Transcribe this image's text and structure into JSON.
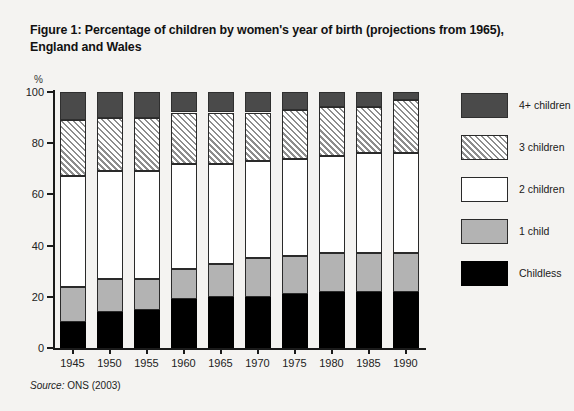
{
  "figure": {
    "title": "Figure 1: Percentage of children by women's year of birth (projections from 1965), England and Wales",
    "source_prefix": "Source:",
    "source_text": " ONS (2003)",
    "background_color": "#f4f3f1"
  },
  "legend": {
    "position": "right",
    "items": [
      {
        "label": "4+ children",
        "swatch": "dark-gray-fill",
        "color": "#4a4a4a"
      },
      {
        "label": "3 children",
        "swatch": "diagonal-hatch-fill",
        "color": "#8d8d8d"
      },
      {
        "label": "2 children",
        "swatch": "white-fill",
        "color": "#ffffff"
      },
      {
        "label": "1 child",
        "swatch": "light-gray-fill",
        "color": "#b3b3b3"
      },
      {
        "label": "Childless",
        "swatch": "black-fill",
        "color": "#000000"
      }
    ]
  },
  "chart_data": {
    "type": "bar",
    "stacked": true,
    "title": "Figure 1: Percentage of children by women's year of birth (projections from 1965), England and Wales",
    "xlabel": "",
    "ylabel": "%",
    "ylim": [
      0,
      100
    ],
    "yticks": [
      0,
      20,
      40,
      60,
      80,
      100
    ],
    "ytick_labels": [
      "0",
      "20",
      "40",
      "60",
      "80",
      "100"
    ],
    "grid": false,
    "legend_position": "right",
    "categories": [
      "1945",
      "1950",
      "1955",
      "1960",
      "1965",
      "1970",
      "1975",
      "1980",
      "1985",
      "1990"
    ],
    "series": [
      {
        "name": "Childless",
        "values": [
          10,
          14,
          15,
          19,
          20,
          20,
          21,
          22,
          22,
          22
        ]
      },
      {
        "name": "1 child",
        "values": [
          14,
          13,
          12,
          12,
          13,
          15,
          15,
          15,
          15,
          15
        ]
      },
      {
        "name": "2 children",
        "values": [
          43,
          42,
          42,
          41,
          39,
          38,
          38,
          38,
          39,
          39
        ]
      },
      {
        "name": "3 children",
        "values": [
          22,
          21,
          21,
          20,
          20,
          19,
          19,
          19,
          18,
          21
        ]
      },
      {
        "name": "4+ children",
        "values": [
          11,
          10,
          10,
          8,
          8,
          8,
          7,
          6,
          6,
          3
        ]
      }
    ]
  },
  "axes": {
    "y_unit": "%"
  }
}
